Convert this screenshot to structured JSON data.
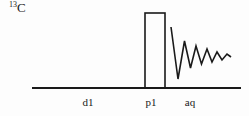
{
  "figure": {
    "type": "nmr-pulse-sequence",
    "width": 249,
    "height": 116,
    "background_color": "#fdfdfd",
    "stroke_color": "#1a1a1a"
  },
  "channel": {
    "nucleus": {
      "mass_number": "13",
      "element_symbol": "C",
      "full_text": "13C"
    }
  },
  "timeline": {
    "baseline": {
      "x_start": 32,
      "x_end": 241,
      "y": 88
    },
    "periods": [
      {
        "id": "d1",
        "label": "d1",
        "description": "relaxation delay",
        "center_x": 88,
        "label_y": 97
      },
      {
        "id": "p1",
        "label": "p1",
        "description": "excitation pulse",
        "center_x": 151,
        "label_y": 97
      },
      {
        "id": "aq",
        "label": "aq",
        "description": "acquisition time",
        "center_x": 190,
        "label_y": 97
      }
    ]
  },
  "pulse": {
    "id": "p1",
    "shape": "rectangular",
    "x": 145,
    "y": 13,
    "width": 20,
    "height": 75,
    "fill": "none",
    "stroke": "#1a1a1a",
    "stroke_width": 1.6
  },
  "fid": {
    "id": "aq",
    "description": "free induction decay, damped oscillation",
    "stroke": "#1a1a1a",
    "stroke_width": 1.6,
    "points": [
      [
        171,
        27
      ],
      [
        178,
        79
      ],
      [
        184.5,
        41
      ],
      [
        190.5,
        68
      ],
      [
        196,
        46
      ],
      [
        201.5,
        64
      ],
      [
        207,
        49
      ],
      [
        212,
        62
      ],
      [
        217,
        52
      ],
      [
        222,
        60
      ],
      [
        227,
        54
      ],
      [
        231,
        57
      ]
    ]
  },
  "chart_data": {
    "type": "line",
    "xlabel": "",
    "ylabel": "",
    "xlim": [
      32,
      241
    ],
    "ylim": [
      0,
      116
    ],
    "grid": false,
    "legend": null,
    "annotations": [
      "13C",
      "d1",
      "p1",
      "aq"
    ],
    "series": [
      {
        "name": "baseline",
        "x": [
          32,
          241
        ],
        "values": [
          88,
          88
        ]
      },
      {
        "name": "p1-pulse",
        "x": [
          145,
          145,
          165,
          165
        ],
        "values": [
          88,
          13,
          13,
          88
        ]
      },
      {
        "name": "fid",
        "x": [
          171,
          178,
          184.5,
          190.5,
          196,
          201.5,
          207,
          212,
          217,
          222,
          227,
          231
        ],
        "values": [
          27,
          79,
          41,
          68,
          46,
          64,
          49,
          62,
          52,
          60,
          54,
          57
        ]
      }
    ]
  }
}
